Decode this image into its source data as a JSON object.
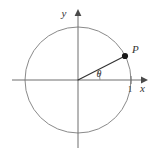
{
  "figure": {
    "kind": "unit-circle-angle-diagram",
    "background_color": "#ffffff",
    "width": 156,
    "height": 156
  },
  "colors": {
    "axis": "#6e6e6e",
    "circle": "#8a8a8a",
    "radius": "#333333",
    "point": "#1a1a1a",
    "label": "#333333",
    "background": "#ffffff"
  },
  "axes": {
    "x_label": "x",
    "y_label": "y",
    "origin_x": 78,
    "origin_y": 80,
    "x_start": 12,
    "x_end": 145,
    "y_top": 12,
    "y_bottom": 148
  },
  "circle": {
    "center_x": 78,
    "center_y": 80,
    "radius": 53
  },
  "tick": {
    "label": "1",
    "x": 131,
    "y": 80
  },
  "point": {
    "label": "P",
    "x": 125,
    "y": 56,
    "dot_radius": 3.1
  },
  "angle": {
    "label": "θ",
    "degrees": 24,
    "arc_radius": 22,
    "label_x": 99,
    "label_y": 77
  }
}
